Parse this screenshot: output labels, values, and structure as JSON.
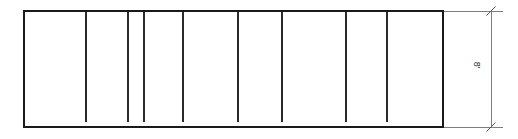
{
  "drawing": {
    "type": "elevation-panel-layout",
    "title": "Panel elevation with vertical dividers",
    "canvas": {
      "width": 518,
      "height": 139,
      "background": "#ffffff"
    },
    "colors": {
      "outline": "#1a1a1a",
      "divider": "#2b2b2b",
      "dimension": "#7d7d7d",
      "tick": "#555555",
      "text": "#2b2b2b"
    },
    "outline": {
      "name": "panel-outline",
      "x": 24,
      "y": 11,
      "width": 419,
      "height": 116,
      "stroke_width": 2.2
    },
    "dividers": {
      "name": "vertical-dividers",
      "count": 8,
      "stroke_width": 1.8,
      "top": 12,
      "bottom": 122,
      "positions": [
        86,
        128,
        144,
        183,
        238,
        282,
        346,
        387
      ]
    },
    "bays": {
      "name": "bay-widths",
      "widths": [
        62,
        42,
        16,
        39,
        55,
        44,
        64,
        41,
        56
      ]
    },
    "dimension": {
      "name": "height-dimension",
      "label": "8'",
      "value": 8,
      "unit": "ft",
      "orientation": "vertical",
      "line_x": 491,
      "line_top": 11,
      "line_bottom": 127,
      "stroke_width": 1,
      "label_x": 477,
      "label_y": 65,
      "rotation_deg": 90,
      "extension_lines": [
        {
          "name": "extension-line-top",
          "x1": 443,
          "y1": 11,
          "x2": 503,
          "y2": 11
        },
        {
          "name": "extension-line-bottom",
          "x1": 443,
          "y1": 127,
          "x2": 503,
          "y2": 127
        }
      ],
      "ticks": [
        {
          "name": "tick-mark-top",
          "x": 491,
          "y": 11
        },
        {
          "name": "tick-mark-bottom",
          "x": 491,
          "y": 127
        }
      ],
      "tick_length": 9
    }
  }
}
